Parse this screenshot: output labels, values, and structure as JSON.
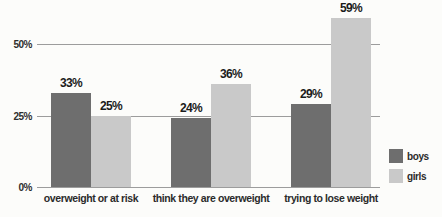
{
  "chart_data": {
    "type": "bar",
    "categories": [
      "overweight or at risk",
      "think they are overweight",
      "trying to lose weight"
    ],
    "series": [
      {
        "name": "boys",
        "color": "#6e6e6e",
        "values": [
          33,
          24,
          29
        ],
        "labels": [
          "33%",
          "24%",
          "29%"
        ]
      },
      {
        "name": "girls",
        "color": "#c9c9c9",
        "values": [
          25,
          36,
          59
        ],
        "labels": [
          "25%",
          "36%",
          "59%"
        ]
      }
    ],
    "title": "",
    "xlabel": "",
    "ylabel": "",
    "ylim": [
      0,
      65
    ],
    "y_ticks": [
      {
        "value": 0,
        "label": "0%"
      },
      {
        "value": 25,
        "label": "25%"
      },
      {
        "value": 50,
        "label": "50%"
      }
    ],
    "grid": true,
    "legend_position": "right",
    "colors": {
      "background": "#fcfcfa",
      "gridline": "#9c9c9c",
      "value_text": "#1b1b1b",
      "axis_text": "#2b2b2b"
    }
  }
}
